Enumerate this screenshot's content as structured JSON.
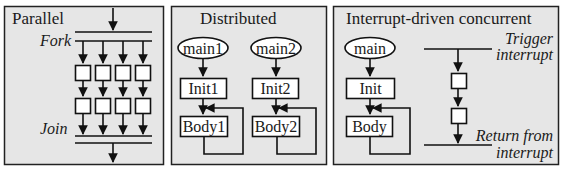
{
  "panels": {
    "parallel": {
      "title": "Parallel",
      "fork_label": "Fork",
      "join_label": "Join",
      "columns": 4,
      "rows": 2
    },
    "distributed": {
      "title": "Distributed",
      "processes": [
        {
          "entry": "main1",
          "init": "Init1",
          "body": "Body1"
        },
        {
          "entry": "main2",
          "init": "Init2",
          "body": "Body2"
        }
      ]
    },
    "interrupt": {
      "title": "Interrupt-driven concurrent",
      "entry": "main",
      "init": "Init",
      "body": "Body",
      "trigger_line1": "Trigger",
      "trigger_line2": "interrupt",
      "return_line1": "Return from",
      "return_line2": "interrupt"
    }
  },
  "colors": {
    "panel_bg": "#e6e6e6",
    "stroke": "#111111",
    "box_fill": "#ffffff"
  }
}
